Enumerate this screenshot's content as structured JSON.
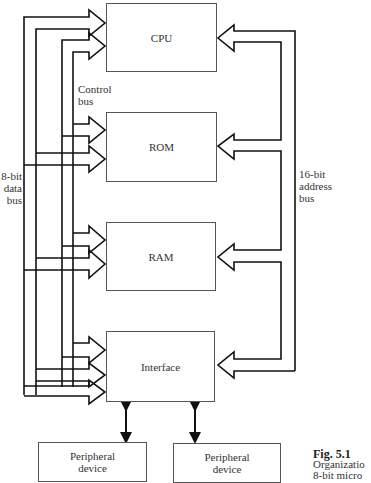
{
  "diagram": {
    "blocks": {
      "cpu": "CPU",
      "rom": "ROM",
      "ram": "RAM",
      "interface": "Interface",
      "peripheral_1": "Peripheral device",
      "peripheral_2": "Peripheral device"
    },
    "bus_labels": {
      "control": [
        "Control",
        "bus"
      ],
      "data": [
        "8-bit",
        "data",
        "bus"
      ],
      "address": [
        "16-bit",
        "address",
        "bus"
      ]
    },
    "caption": {
      "figure": "Fig. 5.1",
      "line1": "Organizatio",
      "line2": "8-bit micro"
    },
    "connections": [
      {
        "from": "data bus",
        "to": "CPU",
        "type": "arrow"
      },
      {
        "from": "data bus",
        "to": "ROM",
        "type": "arrow"
      },
      {
        "from": "data bus",
        "to": "RAM",
        "type": "arrow"
      },
      {
        "from": "data bus",
        "to": "Interface",
        "type": "arrow"
      },
      {
        "from": "control bus",
        "to": "CPU",
        "type": "arrow"
      },
      {
        "from": "control bus",
        "to": "ROM",
        "type": "arrow"
      },
      {
        "from": "control bus",
        "to": "RAM",
        "type": "arrow"
      },
      {
        "from": "control bus",
        "to": "Interface",
        "type": "arrow"
      },
      {
        "from": "address bus",
        "to": "CPU",
        "type": "arrow"
      },
      {
        "from": "address bus",
        "to": "ROM",
        "type": "arrow"
      },
      {
        "from": "address bus",
        "to": "RAM",
        "type": "arrow"
      },
      {
        "from": "address bus",
        "to": "Interface",
        "type": "arrow"
      },
      {
        "from": "Interface",
        "to": "Peripheral device",
        "type": "bidirectional"
      },
      {
        "from": "Interface",
        "to": "Peripheral device",
        "type": "bidirectional"
      }
    ]
  }
}
